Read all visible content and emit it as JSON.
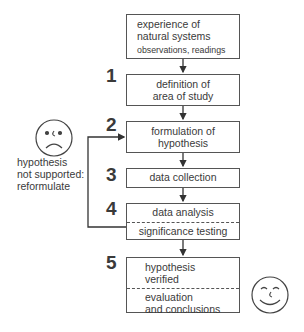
{
  "boxes": [
    {
      "line1": "experience of",
      "line2": "natural systems",
      "sub": "observations, readings"
    },
    {
      "line1": "definition of",
      "line2": "area of study"
    },
    {
      "line1": "formulation of",
      "line2": "hypothesis"
    },
    {
      "line1": "data collection"
    },
    {
      "top": "data analysis",
      "bottom": "significance testing"
    },
    {
      "top1": "hypothesis",
      "top2": "verified",
      "bottom1": "evaluation",
      "bottom2": "and conclusions"
    }
  ],
  "steps": [
    "1",
    "2",
    "3",
    "4",
    "5"
  ],
  "feedback": {
    "line1": "hypothesis",
    "line2": "not supported:",
    "line3": "reformulate"
  },
  "icons": {
    "sad": "sad-face-icon",
    "happy": "happy-face-icon"
  }
}
